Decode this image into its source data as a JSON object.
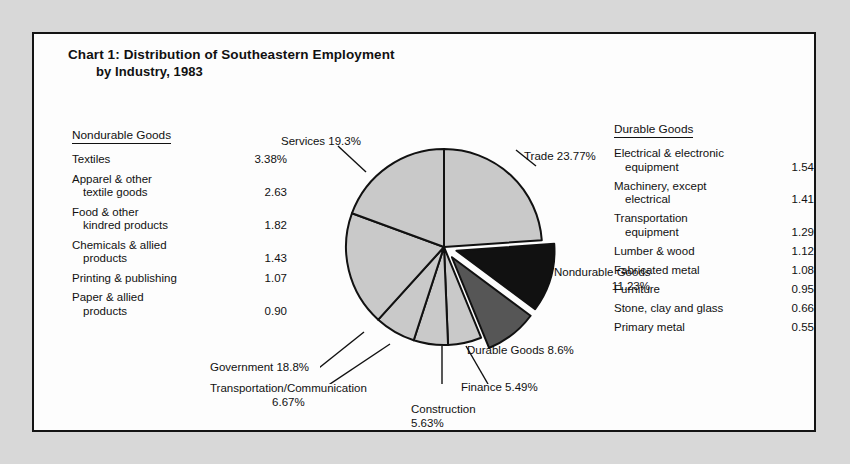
{
  "title": {
    "main": "Chart 1: Distribution of Southeastern Employment",
    "sub": "by Industry, 1983"
  },
  "source": "Source: Unpublished data from Bureau of Labor Statistics, 1983",
  "legend_left": {
    "heading": "Nondurable Goods",
    "rows": [
      {
        "label": "Textiles",
        "indent": "",
        "value": "3.38%"
      },
      {
        "label": "Apparel & other",
        "indent": "textile goods",
        "value": "2.63"
      },
      {
        "label": "Food & other",
        "indent": "kindred products",
        "value": "1.82"
      },
      {
        "label": "Chemicals & allied",
        "indent": "products",
        "value": "1.43"
      },
      {
        "label": "Printing & publishing",
        "indent": "",
        "value": "1.07"
      },
      {
        "label": "Paper & allied",
        "indent": "products",
        "value": "0.90"
      }
    ]
  },
  "legend_right": {
    "heading": "Durable Goods",
    "rows": [
      {
        "label": "Electrical & electronic",
        "indent": "equipment",
        "value": "1.54"
      },
      {
        "label": "Machinery, except",
        "indent": "electrical",
        "value": "1.41"
      },
      {
        "label": "Transportation",
        "indent": "equipment",
        "value": "1.29"
      },
      {
        "label": "Lumber & wood",
        "indent": "",
        "value": "1.12"
      },
      {
        "label": "Fabricated metal",
        "indent": "",
        "value": "1.08"
      },
      {
        "label": "Furniture",
        "indent": "",
        "value": "0.95"
      },
      {
        "label": "Stone, clay and glass",
        "indent": "",
        "value": "0.66"
      },
      {
        "label": "Primary metal",
        "indent": "",
        "value": "0.55"
      }
    ]
  },
  "callouts": {
    "services": "Services 19.3%",
    "trade": "Trade 23.77%",
    "nondurable_l1": "Nondurable Goods",
    "nondurable_l2": "11.23%",
    "durable": "Durable Goods 8.6%",
    "finance": "Finance 5.49%",
    "construction_l1": "Construction",
    "construction_l2": "5.63%",
    "government": "Government 18.8%",
    "transport_l1": "Transportation/Communication",
    "transport_l2": "6.67%"
  },
  "colors": {
    "slice_light": "#c9c9c9",
    "slice_dark": "#565656",
    "slice_black": "#111111",
    "outline": "#111111",
    "page_bg": "#d8d8d8",
    "frame_bg": "#fdfdfd"
  },
  "chart_data": {
    "type": "pie",
    "title": "Chart 1: Distribution of Southeastern Employment by Industry, 1983",
    "unit": "percent of total employment",
    "legend_position": "sides",
    "total": 99.49,
    "categories": [
      "Trade",
      "Nondurable Goods",
      "Durable Goods",
      "Finance",
      "Construction",
      "Transportation/Communication",
      "Government",
      "Services"
    ],
    "values": [
      23.77,
      11.23,
      8.6,
      5.49,
      5.63,
      6.67,
      18.8,
      19.3
    ],
    "slices": [
      {
        "label": "Trade",
        "value": 23.77,
        "fill": "#c9c9c9",
        "exploded": false
      },
      {
        "label": "Nondurable Goods",
        "value": 11.23,
        "fill": "#111111",
        "exploded": true
      },
      {
        "label": "Durable Goods",
        "value": 8.6,
        "fill": "#565656",
        "exploded": true
      },
      {
        "label": "Finance",
        "value": 5.49,
        "fill": "#c9c9c9",
        "exploded": false
      },
      {
        "label": "Construction",
        "value": 5.63,
        "fill": "#c9c9c9",
        "exploded": false
      },
      {
        "label": "Transportation/Communication",
        "value": 6.67,
        "fill": "#c9c9c9",
        "exploded": false
      },
      {
        "label": "Government",
        "value": 18.8,
        "fill": "#c9c9c9",
        "exploded": false
      },
      {
        "label": "Services",
        "value": 19.3,
        "fill": "#c9c9c9",
        "exploded": false
      }
    ],
    "breakdown_nondurable": {
      "Textiles": 3.38,
      "Apparel & other textile goods": 2.63,
      "Food & other kindred products": 1.82,
      "Chemicals & allied products": 1.43,
      "Printing & publishing": 1.07,
      "Paper & allied products": 0.9
    },
    "breakdown_durable": {
      "Electrical & electronic equipment": 1.54,
      "Machinery, except electrical": 1.41,
      "Transportation equipment": 1.29,
      "Lumber & wood": 1.12,
      "Fabricated metal": 1.08,
      "Furniture": 0.95,
      "Stone, clay and glass": 0.66,
      "Primary metal": 0.55
    }
  }
}
